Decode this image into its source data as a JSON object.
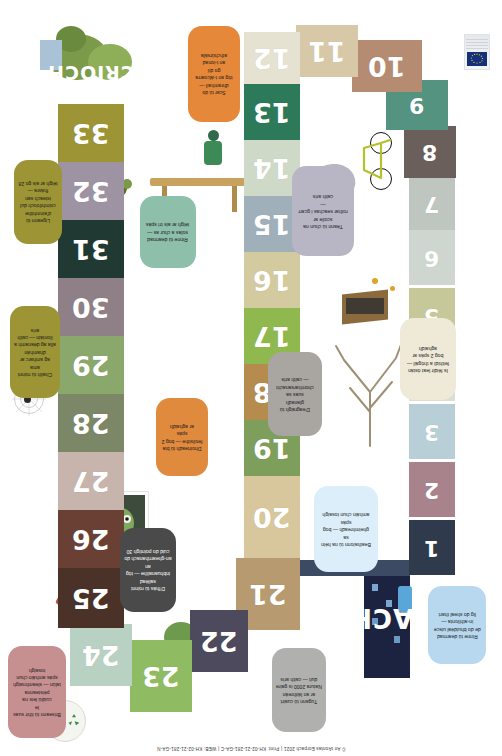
{
  "page": {
    "top_cut_text": "… an-tábhachtach… — an timpeallacht… an domhan… an t-aer… an t-uisce…",
    "footer_credit": "© An tAontas Eorpach 2021  |  Print: KH-02-21-281-GA-C  |  WEB: KH-02-21-281-GA-N",
    "background_color": "#ffffff"
  },
  "board": {
    "start_label": "TOSACH",
    "finish_label": "CRÍOCH",
    "squares": [
      {
        "n": "1",
        "color": "#2f3a4d",
        "x": 409,
        "y": 520,
        "w": 46,
        "h": 55
      },
      {
        "n": "2",
        "color": "#a9838c",
        "x": 409,
        "y": 462,
        "w": 46,
        "h": 55
      },
      {
        "n": "3",
        "color": "#b9cfd8",
        "x": 409,
        "y": 404,
        "w": 46,
        "h": 55
      },
      {
        "n": "4",
        "color": "#d9dfd1",
        "x": 409,
        "y": 346,
        "w": 46,
        "h": 55
      },
      {
        "n": "5",
        "color": "#c6c89a",
        "x": 409,
        "y": 288,
        "w": 46,
        "h": 55
      },
      {
        "n": "6",
        "color": "#cfd6cf",
        "x": 409,
        "y": 230,
        "w": 46,
        "h": 55
      },
      {
        "n": "7",
        "color": "#bfc6bf",
        "x": 409,
        "y": 178,
        "w": 46,
        "h": 52
      },
      {
        "n": "8",
        "color": "#6b5f5c",
        "x": 404,
        "y": 126,
        "w": 52,
        "h": 52
      },
      {
        "n": "9",
        "color": "#53937f",
        "x": 386,
        "y": 80,
        "w": 62,
        "h": 50
      },
      {
        "n": "10",
        "color": "#b58b72",
        "x": 352,
        "y": 40,
        "w": 70,
        "h": 52
      },
      {
        "n": "11",
        "color": "#d7c9a8",
        "x": 296,
        "y": 25,
        "w": 62,
        "h": 52
      },
      {
        "n": "12",
        "color": "#e5e2d2",
        "x": 244,
        "y": 32,
        "w": 56,
        "h": 52
      },
      {
        "n": "13",
        "color": "#2c7a5a",
        "x": 244,
        "y": 84,
        "w": 56,
        "h": 56
      },
      {
        "n": "14",
        "color": "#cfd9c7",
        "x": 244,
        "y": 140,
        "w": 56,
        "h": 56
      },
      {
        "n": "15",
        "color": "#9fb0bb",
        "x": 244,
        "y": 196,
        "w": 56,
        "h": 56
      },
      {
        "n": "16",
        "color": "#d3caa0",
        "x": 244,
        "y": 252,
        "w": 56,
        "h": 56
      },
      {
        "n": "17",
        "color": "#8fb94e",
        "x": 244,
        "y": 308,
        "w": 56,
        "h": 56
      },
      {
        "n": "18",
        "color": "#b68b4e",
        "x": 244,
        "y": 364,
        "w": 56,
        "h": 56
      },
      {
        "n": "19",
        "color": "#7e9e5c",
        "x": 244,
        "y": 420,
        "w": 56,
        "h": 56
      },
      {
        "n": "20",
        "color": "#d8c79c",
        "x": 244,
        "y": 476,
        "w": 56,
        "h": 82
      },
      {
        "n": "21",
        "color": "#b79a6f",
        "x": 236,
        "y": 558,
        "w": 64,
        "h": 72
      },
      {
        "n": "22",
        "color": "#4c4a5c",
        "x": 190,
        "y": 610,
        "w": 58,
        "h": 62
      },
      {
        "n": "23",
        "color": "#8fbc63",
        "x": 130,
        "y": 640,
        "w": 62,
        "h": 72
      },
      {
        "n": "24",
        "color": "#b9d1c2",
        "x": 70,
        "y": 624,
        "w": 62,
        "h": 62
      },
      {
        "n": "25",
        "color": "#4a3228",
        "x": 58,
        "y": 568,
        "w": 66,
        "h": 60
      },
      {
        "n": "26",
        "color": "#6b4034",
        "x": 58,
        "y": 510,
        "w": 66,
        "h": 58
      },
      {
        "n": "27",
        "color": "#c7b5ad",
        "x": 58,
        "y": 452,
        "w": 66,
        "h": 58
      },
      {
        "n": "28",
        "color": "#7c8768",
        "x": 58,
        "y": 394,
        "w": 66,
        "h": 58
      },
      {
        "n": "29",
        "color": "#8aa86b",
        "x": 58,
        "y": 336,
        "w": 66,
        "h": 58
      },
      {
        "n": "30",
        "color": "#8f7f86",
        "x": 58,
        "y": 278,
        "w": 66,
        "h": 58
      },
      {
        "n": "31",
        "color": "#203a33",
        "x": 58,
        "y": 220,
        "w": 66,
        "h": 58
      },
      {
        "n": "32",
        "color": "#9e93a3",
        "x": 58,
        "y": 162,
        "w": 66,
        "h": 58
      },
      {
        "n": "33",
        "color": "#9c9435",
        "x": 58,
        "y": 104,
        "w": 66,
        "h": 58
      }
    ]
  },
  "bubbles": [
    {
      "id": "b1",
      "text": "Rinne tú dearmad\nde do bhuidéal uisce\nin-athlíonta —\nlig do sheal thart",
      "color": "#b7d8ee",
      "x": 428,
      "y": 586,
      "w": 58,
      "h": 78,
      "rot": 180
    },
    {
      "id": "b2",
      "text": "Beathaíonn tú na héin sa\ngheimhreadh — bog spás\namháin chun tosaigh",
      "color": "#dceefa",
      "x": 314,
      "y": 486,
      "w": 64,
      "h": 86,
      "rot": 180
    },
    {
      "id": "b3",
      "text": "Is féidir leat óstán\nfeithidí a thógáil —\nbog 2 spás ar aghaidh",
      "color": "#efe9d8",
      "x": 400,
      "y": 318,
      "w": 56,
      "h": 82,
      "rot": 180
    },
    {
      "id": "b4",
      "text": "Téann tú chun na scoile ar\nrothar seachas i gcarr —\ncaith arís",
      "color": "#b8b6c4",
      "x": 292,
      "y": 166,
      "w": 62,
      "h": 90,
      "rot": 180
    },
    {
      "id": "b5",
      "text": "Scar tú do dhramhaíl —\ntóg an t-álcoarra go dtí\nan t-ionad athchúrsála",
      "color": "#e5883a",
      "x": 188,
      "y": 26,
      "w": 52,
      "h": 96,
      "rot": 180
    },
    {
      "id": "b6",
      "text": "Rinne tú dearmad\nsolas a chur as —\ntéigh ar ais trí spás",
      "color": "#8dbfaa",
      "x": 140,
      "y": 196,
      "w": 56,
      "h": 72,
      "rot": 180
    },
    {
      "id": "b7",
      "text": "D'eagraigh tú glanadh\nsuas sa chomharsanacht\n— caith arís",
      "color": "#a9a5a0",
      "x": 268,
      "y": 352,
      "w": 54,
      "h": 84,
      "rot": 180
    },
    {
      "id": "b8",
      "text": "Dhoirteadh tú bia\nfeoilsithe — bog 2 spás\nar aghaidh",
      "color": "#e08a3e",
      "x": 156,
      "y": 398,
      "w": 52,
      "h": 78,
      "rot": 180
    },
    {
      "id": "b9",
      "text": "D'fhás tú roinnt sailéad\ninbhuanaithe — tóg an\nan-ghearrthanach do\ncuid do pointigh 30",
      "color": "#4a4a4a",
      "x": 120,
      "y": 528,
      "w": 56,
      "h": 84,
      "rot": 180,
      "textcolor": "#ffffff"
    },
    {
      "id": "b10",
      "text": "Briseann tú ithir suas le\ncuidiú leis na péisteanna\ntalún — sleamhnaigh\nspás amháin chun tosaigh",
      "color": "#c79090",
      "x": 8,
      "y": 646,
      "w": 58,
      "h": 92,
      "rot": 180
    },
    {
      "id": "b11",
      "text": "Tugann tú cuairt\nar an láithreán\nNatura 2000 is gaire\nduit — caith arís",
      "color": "#b0b0ae",
      "x": 272,
      "y": 648,
      "w": 54,
      "h": 84,
      "rot": 180
    },
    {
      "id": "b12",
      "text": "Ligeann tú d'ainmhithe\ncoimhthíoch dul\nisteach san fhásra —\ntéigh ar ais go 28",
      "color": "#9c9435",
      "x": 14,
      "y": 160,
      "w": 48,
      "h": 84,
      "rot": 180
    },
    {
      "id": "b13",
      "text": "Chaith tú roinnt ama\nag amharc ar dhamhán\nalla ag déanamh a\nlíontáin — caith arís",
      "color": "#9c9435",
      "x": 10,
      "y": 306,
      "w": 50,
      "h": 92,
      "rot": 180
    }
  ],
  "icons": {
    "recycling": "recycling-icon",
    "eu_flag": "eu-flag-icon",
    "bicycle": "bicycle-icon",
    "spider_web": "spider-web-icon",
    "leaf": "leaf-icon"
  },
  "colors": {
    "accent_orange": "#e5883a",
    "accent_green": "#8fbc63",
    "accent_blue": "#b7d8ee",
    "eu_blue": "#14307d",
    "eu_yellow": "#f5d417"
  }
}
